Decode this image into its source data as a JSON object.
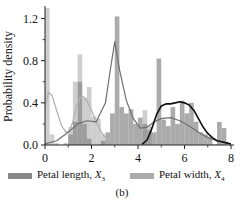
{
  "figure": {
    "caption": "(b)",
    "ylabel": "Probability density",
    "xlabel": ""
  },
  "legend": {
    "items": [
      {
        "key": "petal_length",
        "label_main": "Petal length, ",
        "label_var": "X",
        "label_sub": "3",
        "color": "#888888"
      },
      {
        "key": "petal_width",
        "label_main": "Petal width, ",
        "label_var": "X",
        "label_sub": "4",
        "color": "#aaaaaa"
      }
    ]
  },
  "chart_data": {
    "type": "bar",
    "title": "",
    "xlabel": "",
    "ylabel": "Probability density",
    "xlim": [
      0,
      8
    ],
    "ylim": [
      0.0,
      1.3
    ],
    "xticks": [
      0,
      2,
      4,
      6,
      8
    ],
    "xticklabels": [
      "0",
      "2",
      "4",
      "6",
      "8"
    ],
    "yticks": [
      0.0,
      0.4,
      0.8,
      1.2
    ],
    "yticklabels": [
      "0.0",
      "0.4",
      "0.8",
      "1.2"
    ],
    "grid": false,
    "legend_position": "below",
    "bin_width": 0.2,
    "series": [
      {
        "name": "Petal width, X4",
        "kind": "histogram",
        "color": "#bdbdbd",
        "bins": [
          {
            "x": 0.1,
            "value": 1.35
          },
          {
            "x": 0.3,
            "value": 0.1
          },
          {
            "x": 0.5,
            "value": 0.02
          },
          {
            "x": 0.7,
            "value": 0.0
          },
          {
            "x": 0.9,
            "value": 0.02
          },
          {
            "x": 1.1,
            "value": 0.17
          },
          {
            "x": 1.3,
            "value": 0.6
          },
          {
            "x": 1.5,
            "value": 0.86
          },
          {
            "x": 1.7,
            "value": 0.45
          },
          {
            "x": 1.9,
            "value": 0.55
          },
          {
            "x": 2.1,
            "value": 0.27
          },
          {
            "x": 2.3,
            "value": 0.25
          },
          {
            "x": 2.5,
            "value": 0.1
          },
          {
            "x": 2.7,
            "value": 0.0
          },
          {
            "x": 4.3,
            "value": 0.33
          },
          {
            "x": 4.5,
            "value": 0.18
          }
        ]
      },
      {
        "name": "Petal length, X3",
        "kind": "histogram",
        "color": "#8a8a8a",
        "bins": [
          {
            "x": 1.1,
            "value": 0.1
          },
          {
            "x": 1.3,
            "value": 0.22
          },
          {
            "x": 1.5,
            "value": 0.6
          },
          {
            "x": 1.7,
            "value": 0.2
          },
          {
            "x": 1.9,
            "value": 0.06
          },
          {
            "x": 2.5,
            "value": 0.04
          },
          {
            "x": 2.7,
            "value": 0.12
          },
          {
            "x": 2.9,
            "value": 0.3
          },
          {
            "x": 3.1,
            "value": 1.22
          },
          {
            "x": 3.3,
            "value": 0.36
          },
          {
            "x": 3.5,
            "value": 0.3
          },
          {
            "x": 3.7,
            "value": 0.34
          },
          {
            "x": 3.9,
            "value": 0.2
          },
          {
            "x": 4.1,
            "value": 0.26
          },
          {
            "x": 4.3,
            "value": 0.2
          },
          {
            "x": 4.5,
            "value": 0.14
          },
          {
            "x": 4.7,
            "value": 0.12
          },
          {
            "x": 4.9,
            "value": 0.82
          },
          {
            "x": 5.1,
            "value": 0.24
          },
          {
            "x": 5.3,
            "value": 0.18
          },
          {
            "x": 5.5,
            "value": 0.36
          },
          {
            "x": 5.7,
            "value": 0.2
          },
          {
            "x": 5.9,
            "value": 0.42
          },
          {
            "x": 6.1,
            "value": 0.3
          },
          {
            "x": 6.3,
            "value": 0.4
          },
          {
            "x": 6.5,
            "value": 0.22
          },
          {
            "x": 6.7,
            "value": 0.12
          },
          {
            "x": 6.9,
            "value": 0.1
          },
          {
            "x": 7.1,
            "value": 0.08
          },
          {
            "x": 7.5,
            "value": 0.22
          },
          {
            "x": 7.7,
            "value": 0.16
          }
        ]
      },
      {
        "name": "Fitted density, petal width (light)",
        "kind": "line",
        "color": "#b0b0b0",
        "points": [
          [
            0.0,
            0.36
          ],
          [
            0.15,
            0.5
          ],
          [
            0.3,
            0.47
          ],
          [
            0.5,
            0.33
          ],
          [
            0.7,
            0.19
          ],
          [
            0.9,
            0.12
          ],
          [
            1.05,
            0.13
          ],
          [
            1.2,
            0.22
          ],
          [
            1.35,
            0.36
          ],
          [
            1.5,
            0.45
          ],
          [
            1.65,
            0.46
          ],
          [
            1.8,
            0.42
          ],
          [
            2.0,
            0.33
          ],
          [
            2.2,
            0.22
          ],
          [
            2.4,
            0.13
          ],
          [
            2.6,
            0.07
          ],
          [
            2.9,
            0.03
          ],
          [
            3.2,
            0.01
          ],
          [
            4.0,
            0.0
          ],
          [
            8.0,
            0.0
          ]
        ]
      },
      {
        "name": "Fitted density, petal length (medium)",
        "kind": "line",
        "color": "#6f6f6f",
        "points": [
          [
            0.0,
            0.01
          ],
          [
            0.5,
            0.04
          ],
          [
            1.0,
            0.12
          ],
          [
            1.4,
            0.2
          ],
          [
            1.8,
            0.23
          ],
          [
            2.2,
            0.22
          ],
          [
            2.6,
            0.4
          ],
          [
            2.8,
            0.7
          ],
          [
            3.0,
            0.98
          ],
          [
            3.2,
            0.72
          ],
          [
            3.5,
            0.42
          ],
          [
            3.8,
            0.25
          ],
          [
            4.1,
            0.16
          ],
          [
            4.4,
            0.17
          ],
          [
            4.7,
            0.22
          ],
          [
            5.0,
            0.25
          ],
          [
            5.4,
            0.26
          ],
          [
            5.8,
            0.23
          ],
          [
            6.2,
            0.18
          ],
          [
            6.6,
            0.12
          ],
          [
            7.0,
            0.07
          ],
          [
            7.4,
            0.04
          ],
          [
            7.8,
            0.02
          ],
          [
            8.0,
            0.01
          ]
        ]
      },
      {
        "name": "Fitted density, petal length upper cluster (dark)",
        "kind": "line",
        "color": "#111111",
        "points": [
          [
            4.2,
            0.01
          ],
          [
            4.4,
            0.05
          ],
          [
            4.6,
            0.16
          ],
          [
            4.8,
            0.29
          ],
          [
            5.0,
            0.37
          ],
          [
            5.2,
            0.39
          ],
          [
            5.4,
            0.39
          ],
          [
            5.6,
            0.4
          ],
          [
            5.8,
            0.41
          ],
          [
            6.0,
            0.4
          ],
          [
            6.2,
            0.38
          ],
          [
            6.4,
            0.33
          ],
          [
            6.6,
            0.25
          ],
          [
            6.8,
            0.17
          ],
          [
            7.0,
            0.11
          ],
          [
            7.2,
            0.07
          ],
          [
            7.4,
            0.04
          ],
          [
            7.6,
            0.03
          ],
          [
            7.8,
            0.02
          ],
          [
            8.0,
            0.01
          ]
        ]
      }
    ]
  }
}
